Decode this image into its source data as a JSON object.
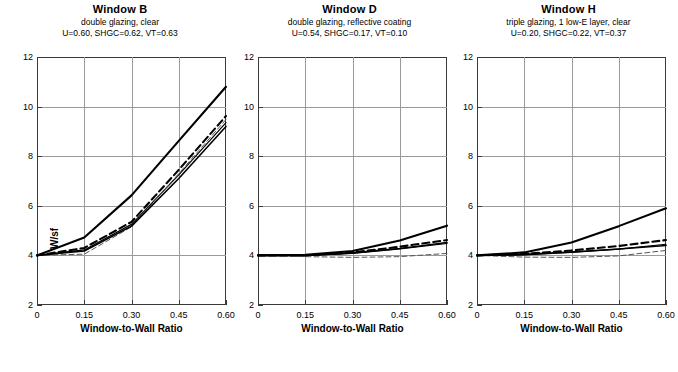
{
  "figure": {
    "axis": {
      "xlabel": "Window-to-Wall Ratio",
      "ylabel": "W/sf",
      "xticks": [
        "0",
        "0.15",
        "0.30",
        "0.45",
        "0.60"
      ],
      "xtick_values": [
        0,
        0.15,
        0.3,
        0.45,
        0.6
      ],
      "yticks": [
        "2",
        "4",
        "6",
        "8",
        "10",
        "12"
      ],
      "ytick_values": [
        2,
        4,
        6,
        8,
        10,
        12
      ],
      "xlim": [
        0,
        0.6
      ],
      "ylim": [
        2,
        12
      ]
    }
  },
  "chart_data": [
    {
      "type": "line",
      "title": "Window B",
      "subtitle": "double glazing, clear",
      "properties": "U=0.60, SHGC=0.62, VT=0.63",
      "xlabel": "Window-to-Wall Ratio",
      "ylabel": "W/sf",
      "x": [
        0,
        0.15,
        0.3,
        0.45,
        0.6
      ],
      "xlim": [
        0,
        0.6
      ],
      "ylim": [
        2,
        12
      ],
      "grid": true,
      "legend": "none",
      "series": [
        {
          "name": "thick-solid",
          "style": "solid",
          "width": 2.1,
          "color": "#000000",
          "values": [
            4.0,
            4.72,
            6.42,
            8.62,
            10.8
          ]
        },
        {
          "name": "thick-dashed",
          "style": "dashed",
          "width": 2.1,
          "color": "#000000",
          "values": [
            4.0,
            4.3,
            5.35,
            7.45,
            9.62
          ]
        },
        {
          "name": "medium-solid",
          "style": "solid",
          "width": 1.2,
          "color": "#000000",
          "values": [
            4.0,
            4.22,
            5.25,
            7.25,
            9.35
          ]
        },
        {
          "name": "thin-dashed",
          "style": "dashed",
          "width": 1.0,
          "color": "#555555",
          "values": [
            4.0,
            4.05,
            5.15,
            7.3,
            9.48
          ]
        },
        {
          "name": "thin-solid",
          "style": "solid",
          "width": 1.6,
          "color": "#000000",
          "values": [
            4.0,
            4.18,
            5.18,
            7.1,
            9.2
          ]
        }
      ]
    },
    {
      "type": "line",
      "title": "Window D",
      "subtitle": "double glazing, reflective coating",
      "properties": "U=0.54, SHGC=0.17, VT=0.10",
      "xlabel": "Window-to-Wall Ratio",
      "ylabel": "W/sf",
      "x": [
        0,
        0.15,
        0.3,
        0.45,
        0.6
      ],
      "xlim": [
        0,
        0.6
      ],
      "ylim": [
        2,
        12
      ],
      "grid": true,
      "legend": "none",
      "series": [
        {
          "name": "thick-solid",
          "style": "solid",
          "width": 2.1,
          "color": "#000000",
          "values": [
            4.0,
            4.02,
            4.18,
            4.6,
            5.2
          ]
        },
        {
          "name": "thick-dashed",
          "style": "dashed",
          "width": 2.1,
          "color": "#000000",
          "values": [
            4.0,
            4.0,
            4.12,
            4.35,
            4.62
          ]
        },
        {
          "name": "medium-solid",
          "style": "solid",
          "width": 1.2,
          "color": "#000000",
          "values": [
            4.0,
            3.99,
            4.08,
            4.26,
            4.48
          ]
        },
        {
          "name": "thin-dashed",
          "style": "dashed",
          "width": 1.0,
          "color": "#555555",
          "values": [
            4.0,
            3.95,
            3.92,
            3.95,
            4.08
          ]
        },
        {
          "name": "thin-solid",
          "style": "solid",
          "width": 1.6,
          "color": "#000000",
          "values": [
            4.0,
            4.0,
            4.1,
            4.28,
            4.52
          ]
        }
      ]
    },
    {
      "type": "line",
      "title": "Window H",
      "subtitle": "triple glazing, 1 low-E layer, clear",
      "properties": "U=0.20, SHGC=0.22, VT=0.37",
      "xlabel": "Window-to-Wall Ratio",
      "ylabel": "W/sf",
      "x": [
        0,
        0.15,
        0.3,
        0.45,
        0.6
      ],
      "xlim": [
        0,
        0.6
      ],
      "ylim": [
        2,
        12
      ],
      "grid": true,
      "legend": "none",
      "series": [
        {
          "name": "thick-solid",
          "style": "solid",
          "width": 2.1,
          "color": "#000000",
          "values": [
            4.0,
            4.12,
            4.52,
            5.18,
            5.9
          ]
        },
        {
          "name": "thick-dashed",
          "style": "dashed",
          "width": 2.1,
          "color": "#000000",
          "values": [
            4.0,
            4.06,
            4.2,
            4.38,
            4.62
          ]
        },
        {
          "name": "medium-solid",
          "style": "solid",
          "width": 1.2,
          "color": "#000000",
          "values": [
            4.0,
            4.02,
            4.12,
            4.25,
            4.45
          ]
        },
        {
          "name": "thin-dashed",
          "style": "dashed",
          "width": 1.0,
          "color": "#555555",
          "values": [
            4.0,
            3.93,
            3.92,
            3.98,
            4.2
          ]
        },
        {
          "name": "thin-solid",
          "style": "solid",
          "width": 1.6,
          "color": "#000000",
          "values": [
            4.0,
            4.04,
            4.14,
            4.26,
            4.4
          ]
        }
      ]
    }
  ]
}
